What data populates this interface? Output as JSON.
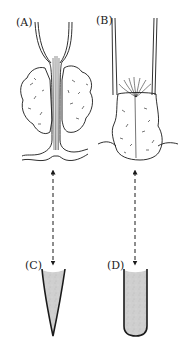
{
  "figure": {
    "panels": [
      {
        "id": "A",
        "label": "(A)",
        "description": "tubular structure passing through a bilobed gland"
      },
      {
        "id": "B",
        "label": "(B)",
        "description": "wide tube ending in fan of fibers over gland mass"
      },
      {
        "id": "C",
        "label": "(C)",
        "description": "conical (pointed) shaded vessel"
      },
      {
        "id": "D",
        "label": "(D)",
        "description": "round-bottomed shaded tube"
      }
    ],
    "arrows": [
      {
        "from": "A",
        "to": "C",
        "style": "dashed",
        "direction": "bidirectional"
      },
      {
        "from": "B",
        "to": "D",
        "style": "dashed",
        "direction": "bidirectional"
      }
    ],
    "colors": {
      "line": "#1a1a1a",
      "fill_shade": "#c9c9c9",
      "background": "#ffffff"
    }
  }
}
